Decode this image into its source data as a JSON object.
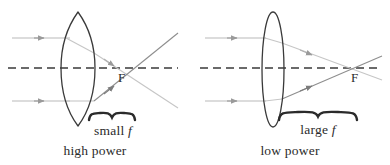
{
  "figure": {
    "background_color": "#ffffff",
    "ink_color": "#3a3a3a",
    "ray_color": "#b9b9b9",
    "ray_color_dark": "#8e8e8e"
  },
  "panels": [
    {
      "id": "high-power",
      "caption": "high power",
      "focal_label": "F",
      "focal_length_text_prefix": "small",
      "focal_length_text_italic": "f",
      "lens_type": "thick-biconvex",
      "lens_center_x": 78,
      "lens_top_y": 12,
      "lens_bottom_y": 126,
      "lens_half_width": 17,
      "axis_y": 68,
      "focal_point_x": 124,
      "focal_length_px": 46,
      "caption_x": 95,
      "caption_y": 143
    },
    {
      "id": "low-power",
      "caption": "low power",
      "focal_label": "F",
      "focal_length_text_prefix": "large",
      "focal_length_text_italic": "f",
      "lens_type": "thin-biconvex",
      "lens_center_x": 273,
      "lens_top_y": 12,
      "lens_bottom_y": 127,
      "lens_half_width": 11,
      "axis_y": 68,
      "focal_point_x": 357,
      "focal_length_px": 84,
      "caption_x": 290,
      "caption_y": 143
    }
  ],
  "annotations": {
    "small_f": {
      "prefix": "small",
      "symbol": "f",
      "x": 113,
      "y": 124
    },
    "large_f": {
      "prefix": "large",
      "symbol": "f",
      "x": 318,
      "y": 124
    },
    "f_left": {
      "text": "F",
      "x": 119,
      "y": 71
    },
    "f_right": {
      "text": "F",
      "x": 352,
      "y": 71
    }
  },
  "rays": {
    "left": {
      "incoming_upper_y": 38,
      "incoming_lower_y": 101,
      "incoming_start_x": 12,
      "arrow_upper_x": 40,
      "arrow_lower_x": 40
    },
    "right": {
      "incoming_upper_y": 38,
      "incoming_lower_y": 101,
      "incoming_start_x": 205,
      "arrow_upper_x": 233,
      "arrow_lower_x": 233
    }
  }
}
